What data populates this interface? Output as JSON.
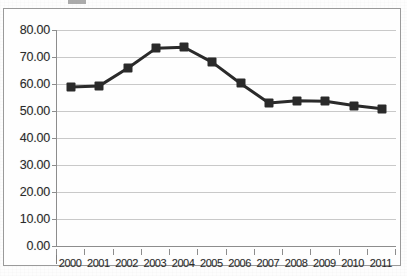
{
  "figure": {
    "frame_color": "#9a9a9a",
    "plot_bg": "#fefefe",
    "grid_color": "#c9c9c9",
    "series_color": "#2a2a2a",
    "title_remnant": ""
  },
  "chart_data": {
    "type": "line",
    "title": "",
    "xlabel": "",
    "ylabel": "",
    "categories": [
      "2000",
      "2001",
      "2002",
      "2003",
      "2004",
      "2005",
      "2006",
      "2007",
      "2008",
      "2009",
      "2010",
      "2011"
    ],
    "values": [
      58.9,
      59.3,
      65.8,
      73.2,
      73.6,
      68.0,
      60.2,
      53.0,
      53.8,
      53.6,
      52.0,
      50.8
    ],
    "ylim": [
      0,
      80
    ],
    "ytick_values": [
      0,
      10,
      20,
      30,
      40,
      50,
      60,
      70,
      80
    ],
    "ytick_labels": [
      "0.00",
      "10.00",
      "20.00",
      "30.00",
      "40.00",
      "50.00",
      "60.00",
      "70.00",
      "80.00"
    ],
    "xtick_labels": [
      "2000",
      "2001",
      "2002",
      "2003",
      "2004",
      "2005",
      "2006",
      "2007",
      "2008",
      "2009",
      "2010",
      "2011"
    ],
    "grid": "horizontal",
    "legend": "none",
    "marker": "square",
    "line_width": 3
  }
}
